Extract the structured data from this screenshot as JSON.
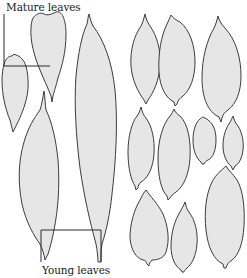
{
  "diagram": {
    "labels": {
      "mature": "Mature leaves",
      "young": "Young leaves"
    },
    "colors": {
      "leaf_fill": "#e6e6e6",
      "leaf_outline": "#3c3c3c",
      "leader_line": "#2a2a2a",
      "background": "#ffffff"
    },
    "groups": [
      {
        "name": "left-group",
        "leaf_count": 4,
        "description": "elongated leaves with leader lines"
      },
      {
        "name": "right-grid",
        "leaf_count": 12,
        "rows": 3
      }
    ]
  }
}
